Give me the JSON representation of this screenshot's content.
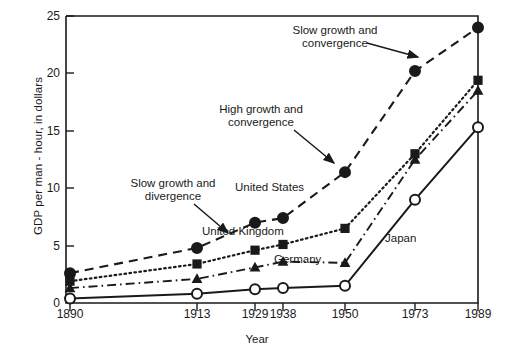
{
  "chart_data": {
    "type": "line",
    "title": "",
    "xlabel": "Year",
    "ylabel": "GDP per man - hour, in dollars",
    "categories": [
      "1890",
      "1913",
      "1929",
      "1938",
      "1950",
      "1973",
      "1989"
    ],
    "x": [
      1890,
      1913,
      1929,
      1938,
      1950,
      1973,
      1989
    ],
    "ylim": [
      0,
      25
    ],
    "yticks": [
      "0",
      "5",
      "10",
      "15",
      "20",
      "25"
    ],
    "ytick_values": [
      0,
      5,
      10,
      15,
      20,
      25
    ],
    "grid": false,
    "legend": "inline-labels",
    "series": [
      {
        "name": "United States",
        "marker": "filled-circle",
        "line": "dashed",
        "values": [
          2.6,
          4.8,
          7.0,
          7.4,
          11.4,
          20.2,
          24.0
        ]
      },
      {
        "name": "United Kingdom",
        "marker": "filled-square",
        "line": "dotted",
        "values": [
          1.9,
          3.4,
          4.6,
          5.1,
          6.5,
          13.0,
          19.4
        ]
      },
      {
        "name": "Germany",
        "marker": "filled-triangle",
        "line": "dash-dot",
        "values": [
          1.3,
          2.1,
          3.1,
          3.6,
          3.5,
          12.5,
          18.5
        ]
      },
      {
        "name": "Japan",
        "marker": "open-circle",
        "line": "solid",
        "values": [
          0.4,
          0.8,
          1.2,
          1.3,
          1.5,
          9.0,
          15.3
        ]
      }
    ],
    "annotations": [
      {
        "id": "slow-growth-convergence",
        "text_line1": "Slow growth and",
        "text_line2": "convergence"
      },
      {
        "id": "high-growth-convergence",
        "text_line1": "High growth and",
        "text_line2": "convergence"
      },
      {
        "id": "slow-growth-divergence",
        "text_line1": "Slow growth and",
        "text_line2": "divergence"
      }
    ]
  },
  "axis": {
    "y_title": "GDP per man - hour, in dollars",
    "x_title": "Year"
  },
  "colors": {
    "ink": "#1a1a1a",
    "background": "#ffffff"
  }
}
